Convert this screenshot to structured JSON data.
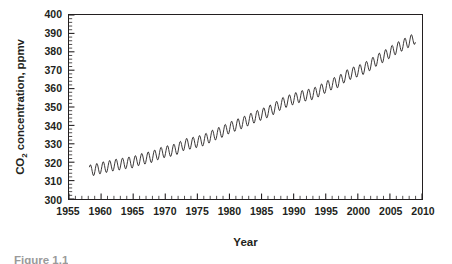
{
  "figure": {
    "caption": "Figure 1.1",
    "background_color": "#ffffff",
    "ink_color": "#231f20"
  },
  "axis_titles": {
    "y_prefix": "CO",
    "y_subscript": "2",
    "y_suffix": " concentration, ppmv",
    "y_full": "CO2 concentration, ppmv",
    "x": "Year"
  },
  "chart_data": {
    "type": "line",
    "title": "",
    "xlabel": "Year",
    "ylabel": "CO2 concentration, ppmv",
    "xlim": [
      1955,
      2010
    ],
    "ylim": [
      300,
      400
    ],
    "grid": false,
    "legend": null,
    "x_ticks": [
      1955,
      1960,
      1965,
      1970,
      1975,
      1980,
      1985,
      1990,
      1995,
      2000,
      2005,
      2010
    ],
    "x_tick_labels": [
      "1955",
      "1960",
      "1965",
      "1970",
      "1975",
      "1980",
      "1985",
      "1990",
      "1995",
      "2000",
      "2005",
      "2010"
    ],
    "x_minor_tick_step": 1,
    "y_ticks": [
      300,
      310,
      320,
      330,
      340,
      350,
      360,
      370,
      380,
      390,
      400
    ],
    "y_tick_labels": [
      "300",
      "310",
      "320",
      "330",
      "340",
      "350",
      "360",
      "370",
      "380",
      "390",
      "400"
    ],
    "y_minor_tick_step": 2,
    "series": [
      {
        "name": "Atmospheric CO2 concentration (Mauna Loa)",
        "color": "#231f20",
        "line_width": 0.9,
        "x_start": 1958.2,
        "x_end": 2009.0,
        "samples_per_year": 12,
        "seasonal_amplitude_ppmv": 3.1,
        "seasonal_peak_month": 4,
        "annual_mean": {
          "years": [
            1958,
            1959,
            1960,
            1961,
            1962,
            1963,
            1964,
            1965,
            1966,
            1967,
            1968,
            1969,
            1970,
            1971,
            1972,
            1973,
            1974,
            1975,
            1976,
            1977,
            1978,
            1979,
            1980,
            1981,
            1982,
            1983,
            1984,
            1985,
            1986,
            1987,
            1988,
            1989,
            1990,
            1991,
            1992,
            1993,
            1994,
            1995,
            1996,
            1997,
            1998,
            1999,
            2000,
            2001,
            2002,
            2003,
            2004,
            2005,
            2006,
            2007,
            2008,
            2009
          ],
          "values": [
            315.3,
            315.9,
            316.9,
            317.6,
            318.4,
            318.9,
            319.6,
            320.0,
            321.4,
            322.2,
            323.0,
            324.6,
            325.7,
            326.3,
            327.5,
            329.7,
            330.2,
            331.1,
            332.0,
            333.8,
            335.4,
            336.8,
            338.7,
            340.1,
            341.4,
            343.0,
            344.6,
            346.0,
            347.4,
            349.2,
            351.6,
            353.1,
            354.4,
            355.6,
            356.4,
            357.1,
            358.8,
            360.8,
            362.6,
            363.7,
            366.6,
            368.3,
            369.5,
            371.0,
            373.1,
            375.6,
            377.4,
            379.7,
            381.8,
            383.7,
            385.6,
            387.4
          ]
        }
      }
    ]
  }
}
